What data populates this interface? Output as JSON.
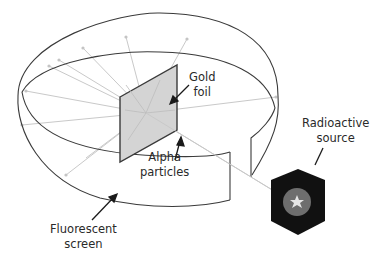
{
  "diagram": {
    "labels": {
      "gold_foil": {
        "line1": "Gold",
        "line2": "foil"
      },
      "alpha_particles": {
        "line1": "Alpha",
        "line2": "particles"
      },
      "radioactive_source": {
        "line1": "Radioactive",
        "line2": "source"
      },
      "fluorescent_screen": {
        "line1": "Fluorescent",
        "line2": "screen"
      }
    },
    "colors": {
      "outline": "#3a3a3a",
      "foil_fill": "#d4d4d4",
      "rays": "#c8c8c8",
      "source_body": "#111111",
      "source_core": "#6e6e6e",
      "background": "#ffffff"
    }
  }
}
